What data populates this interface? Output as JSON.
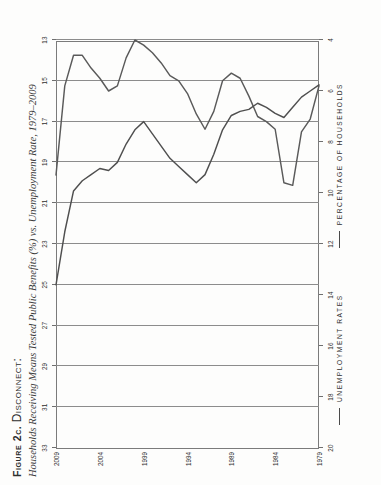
{
  "figure": {
    "number_label": "Figure 2c.",
    "keyword": "Disconnect:",
    "subtitle": "Households Receiving Means Tested Public Benefits (%) vs. Unemployment Rate, 1979–2009"
  },
  "legend": {
    "items": [
      {
        "label": "UNEMPLOYMENT RATES",
        "color": "#4a4a4a"
      },
      {
        "label": "PERCENTAGE OF HOUSEHOLDS",
        "color": "#4a4a4a"
      }
    ]
  },
  "chart_data": {
    "type": "line",
    "title": "Households Receiving Means Tested Public Benefits (%) vs. Unemployment Rate, 1979–2009",
    "orientation": "rotated-90-ccw",
    "x": [
      1979,
      1980,
      1981,
      1982,
      1983,
      1984,
      1985,
      1986,
      1987,
      1988,
      1989,
      1990,
      1991,
      1992,
      1993,
      1994,
      1995,
      1996,
      1997,
      1998,
      1999,
      2000,
      2001,
      2002,
      2003,
      2004,
      2005,
      2006,
      2007,
      2008,
      2009
    ],
    "xlabel": "",
    "xticks": [
      1979,
      1984,
      1989,
      1994,
      1999,
      2004,
      2009
    ],
    "xtick_labels": [
      "1979",
      "1984",
      "1989",
      "1994",
      "1999",
      "2004",
      "2009"
    ],
    "grid": true,
    "axes": [
      {
        "id": "unemployment",
        "position": "bottom",
        "label": "UNEMPLOYMENT RATES",
        "ticks": [
          20,
          18,
          16,
          14,
          12,
          10,
          8,
          6,
          4
        ],
        "tick_labels": [
          "20",
          "18",
          "16",
          "14",
          "12",
          "10",
          "8",
          "6",
          "4"
        ],
        "lim": [
          20,
          4
        ],
        "unit": "%"
      },
      {
        "id": "households",
        "position": "top",
        "label": "PERCENTAGE OF HOUSEHOLDS",
        "ticks": [
          33,
          31,
          29,
          27,
          25,
          23,
          21,
          19,
          17,
          15,
          13
        ],
        "tick_labels": [
          "33",
          "31",
          "29",
          "27",
          "25",
          "23",
          "21",
          "19",
          "17",
          "15",
          "13"
        ],
        "lim": [
          33,
          13
        ],
        "unit": "%"
      }
    ],
    "series": [
      {
        "name": "UNEMPLOYMENT RATES",
        "axis": "unemployment",
        "color": "#4a4a4a",
        "values": [
          5.8,
          7.1,
          7.6,
          9.7,
          9.6,
          7.5,
          7.2,
          7.0,
          6.2,
          5.5,
          5.3,
          5.6,
          6.8,
          7.5,
          6.9,
          6.1,
          5.6,
          5.4,
          4.9,
          4.5,
          4.2,
          4.0,
          4.7,
          5.8,
          6.0,
          5.5,
          5.1,
          4.6,
          4.6,
          5.8,
          9.3
        ]
      },
      {
        "name": "PERCENTAGE OF HOUSEHOLDS",
        "axis": "households",
        "color": "#4f4f4f",
        "values": [
          15.2,
          15.5,
          15.8,
          16.3,
          16.8,
          16.6,
          16.3,
          16.1,
          16.4,
          16.5,
          16.7,
          17.4,
          18.6,
          19.6,
          20.0,
          19.6,
          19.2,
          18.8,
          18.2,
          17.6,
          17.0,
          17.4,
          18.1,
          19.0,
          19.4,
          19.3,
          19.6,
          19.9,
          20.4,
          22.4,
          25.0
        ]
      }
    ]
  }
}
